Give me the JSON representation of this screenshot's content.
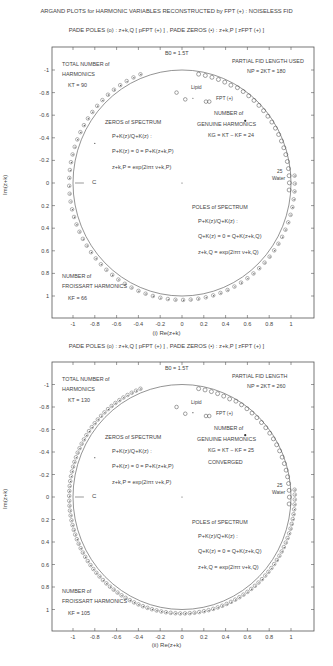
{
  "figure": {
    "title": "ARGAND PLOTS for HARMONIC VARIABLES RECONSTRUCTED by FPT (+) : NOISELESS FID",
    "legend_line": "PADE POLES (o) : z+k,Q [ pFPT (+) ] ,  PADE ZEROS (•) : z+k,P [ zFPT (+) ]"
  },
  "panels": [
    {
      "id": "i",
      "subtitle": "PADE POLES (o) : z+k,Q [ pFPT (+) ] ,  PADE ZEROS (•) : z+k,P [ zFPT (+) ]",
      "xlabel": "(i)  Re(z+k)",
      "ylabel": "Im(z+k)",
      "b0": "B0 = 1.5T",
      "total_label_1": "TOTAL NUMBER of",
      "total_label_2": "HARMONICS",
      "total_value": "KT = 90",
      "partial_label": "PARTIAL FID LENGTH USED",
      "partial_value": "NP = 2KT = 180",
      "zeros_title": "ZEROS of SPECTRUM",
      "zeros_eq1": "P+K(z)/Q+K(z) :",
      "zeros_eq2": "P+K(z) = 0 = P+K(z+k,P)",
      "zeros_eq3": "z+k,P = exp(2iπτ ν+k,P)",
      "genuine_1": "NUMBER of",
      "genuine_2": "GENUINE HARMONICS",
      "genuine_value": "KG = KT − KF = 24",
      "converged": "",
      "poles_title": "POLES of SPECTRUM",
      "poles_eq1": "P+K(z)/Q+K(z) :",
      "poles_eq2": "Q+K(z) = 0 = Q+K(z+k,Q)",
      "poles_eq3": "z+k,Q = exp(2iπτ ν+k,Q)",
      "froissart_1": "NUMBER of",
      "froissart_2": "FROISSART HARMONICS",
      "froissart_value": "KF = 66",
      "fpt_label": "FPT (+)",
      "lipid_label": "Lipid",
      "water_label": "Water",
      "water_num": "25",
      "c_label": "C"
    },
    {
      "id": "ii",
      "subtitle": "PADE POLES (o) : z+k,Q [ pFPT (+) ] ,  PADE ZEROS (•) : z+k,P [ zFPT (+) ]",
      "xlabel": "(ii)  Re(z+k)",
      "ylabel": "Im(z+k)",
      "b0": "B0 = 1.5T",
      "total_label_1": "TOTAL NUMBER of",
      "total_label_2": "HARMONICS",
      "total_value": "KT = 130",
      "partial_label": "PARTIAL FID LENGTH",
      "partial_value": "NP = 2KT = 260",
      "zeros_title": "ZEROS of SPECTRUM",
      "zeros_eq1": "P+K(z)/Q+K(z) :",
      "zeros_eq2": "P+K(z) = 0 = P+K(z+k,P)",
      "zeros_eq3": "z+k,P = exp(2iπτ ν+k,P)",
      "genuine_1": "NUMBER of",
      "genuine_2": "GENUINE HARMONICS",
      "genuine_value": "KG = KT − KF = 25",
      "converged": "CONVERGED",
      "poles_title": "POLES of SPECTRUM",
      "poles_eq1": "P+K(z)/Q+K(z) :",
      "poles_eq2": "Q+K(z) = 0 = Q+K(z+k,Q)",
      "poles_eq3": "z+k,Q = exp(2iπτ ν+k,Q)",
      "froissart_1": "NUMBER of",
      "froissart_2": "FROISSART HARMONICS",
      "froissart_value": "KF = 105",
      "fpt_label": "FPT (+)",
      "lipid_label": "Lipid",
      "water_label": "Water",
      "water_num": "25",
      "c_label": "C"
    }
  ],
  "chart_data": [
    {
      "type": "scatter",
      "title": "PADE POLES (o) : z+k,Q [ pFPT(+) ] , PADE ZEROS (•) : z+k,P [ zFPT(+) ]",
      "xlabel": "(i) Re(z+k)",
      "ylabel": "Im(z+k)",
      "xlim": [
        -1.2,
        1.2
      ],
      "ylim": [
        -1.2,
        1.2
      ],
      "xticks": [
        "-1",
        "-0.8",
        "-0.6",
        "-0.4",
        "-0.2",
        "0",
        "0.2",
        "0.4",
        "0.6",
        "0.8",
        "1"
      ],
      "yticks": [
        "1",
        "0.8",
        "0.6",
        "0.4",
        "0.2",
        "0",
        "-0.2",
        "-0.4",
        "-0.6",
        "-0.8",
        "-1"
      ],
      "grid": false,
      "series": [
        {
          "name": "unit circle C",
          "kind": "line",
          "description": "circle of radius 1"
        },
        {
          "name": "Pade poles (o) + zeros (•) Froissart doublets",
          "count": 66,
          "radius_approx": 1.03,
          "description": "pole-zero pairs near/outside unit circle"
        },
        {
          "name": "Genuine poles (o)",
          "count": 24,
          "region": "upper right arc, Re 0.5–1, Im 0–0.7",
          "points_inside": [
            [
              -0.05,
              0.78
            ],
            [
              0.03,
              0.75
            ],
            [
              0.22,
              0.72
            ],
            [
              0.4,
              0.6
            ],
            [
              0.78,
              0.33
            ]
          ]
        },
        {
          "name": "Spurious zero",
          "point": [
            0.0,
            0.0
          ]
        }
      ],
      "annotations": [
        "B0 = 1.5T",
        "KT = 90",
        "NP = 2KT = 180",
        "KG = KT − KF = 24",
        "KF = 66",
        "Lipid",
        "Water 25",
        "FPT(+)",
        "C"
      ]
    },
    {
      "type": "scatter",
      "title": "PADE POLES (o) : z+k,Q [ pFPT(+) ] , PADE ZEROS (•) : z+k,P [ zFPT(+) ]",
      "xlabel": "(ii) Re(z+k)",
      "ylabel": "Im(z+k)",
      "xlim": [
        -1.2,
        1.2
      ],
      "ylim": [
        -1.2,
        1.2
      ],
      "xticks": [
        "-1",
        "-0.8",
        "-0.6",
        "-0.4",
        "-0.2",
        "0",
        "0.2",
        "0.4",
        "0.6",
        "0.8",
        "1"
      ],
      "yticks": [
        "1",
        "0.8",
        "0.6",
        "0.4",
        "0.2",
        "0",
        "-0.2",
        "-0.4",
        "-0.6",
        "-0.8",
        "-1"
      ],
      "grid": false,
      "series": [
        {
          "name": "unit circle C",
          "kind": "line"
        },
        {
          "name": "Pade poles (o) + zeros (•) Froissart doublets",
          "count": 105,
          "radius_approx": 1.03
        },
        {
          "name": "Genuine poles (o)",
          "count": 25,
          "region": "upper right arc"
        },
        {
          "name": "Spurious zero",
          "point": [
            0.0,
            0.0
          ]
        }
      ],
      "annotations": [
        "B0 = 1.5T",
        "KT = 130",
        "NP = 2KT = 260",
        "KG = KT − KF = 25",
        "CONVERGED",
        "KF = 105",
        "Lipid",
        "Water 25",
        "FPT(+)",
        "C"
      ]
    }
  ]
}
